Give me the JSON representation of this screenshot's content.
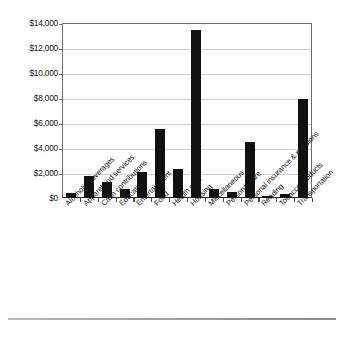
{
  "chart_data": {
    "type": "bar",
    "title": "",
    "subtitle": "",
    "xlabel": "",
    "ylabel": "",
    "ylim": [
      0,
      14000
    ],
    "ytick_values": [
      0,
      2000,
      4000,
      6000,
      8000,
      10000,
      12000,
      14000
    ],
    "ytick_labels": [
      "$0",
      "$2,000",
      "$4,000",
      "$6,000",
      "$8,000",
      "$10,000",
      "$12,000",
      "$14,000"
    ],
    "grid": true,
    "legend": false,
    "bar_color": "#111111",
    "gridline_color": "#d2d2d2",
    "axis_color": "#6d6d6d",
    "categories": [
      "Alcoholic beverages",
      "Apparel and services",
      "Cash contributions",
      "Education",
      "Entertainment",
      "Food",
      "Health care",
      "Housing",
      "Miscellaneous",
      "Personal care",
      "Personal insurance & pensions",
      "Reading",
      "Tobacco products",
      "Transportation"
    ],
    "values": [
      400,
      1750,
      1280,
      720,
      2080,
      5500,
      2300,
      13450,
      750,
      500,
      4450,
      150,
      300,
      7900
    ]
  }
}
